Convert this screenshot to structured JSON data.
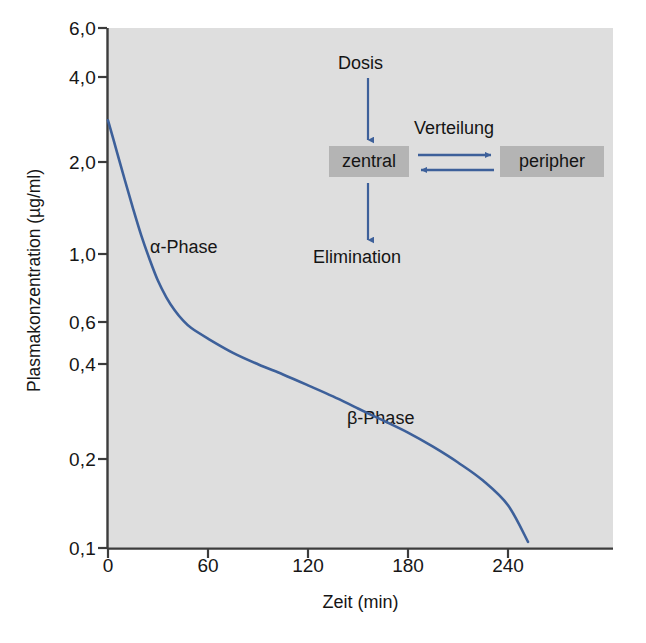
{
  "chart_data": {
    "type": "line",
    "title": "",
    "xlabel": "Zeit (min)",
    "ylabel": "Plasmakonzentration (µg/ml)",
    "yscale": "log",
    "xlim": [
      0,
      280
    ],
    "ylim": [
      0.1,
      6.0
    ],
    "grid": false,
    "legend": null,
    "xticks": [
      0,
      60,
      120,
      180,
      240
    ],
    "xticklabels": [
      "0",
      "60",
      "120",
      "180",
      "240"
    ],
    "yticks": [
      6.0,
      4.0,
      2.0,
      1.0,
      0.6,
      0.4,
      0.2,
      0.1
    ],
    "yticklabels": [
      "6,0",
      "4,0",
      "2,0",
      "1,0",
      "0,6",
      "0,4",
      "0,2",
      "0,1"
    ],
    "series": [
      {
        "name": "Plasmakonzentration",
        "color": "#3d609a",
        "x": [
          0,
          5,
          10,
          15,
          20,
          25,
          30,
          35,
          40,
          45,
          50,
          60,
          75,
          90,
          105,
          120,
          135,
          150,
          165,
          180,
          195,
          210,
          225,
          240,
          252
        ],
        "y": [
          2.9,
          2.3,
          1.82,
          1.45,
          1.17,
          0.97,
          0.82,
          0.72,
          0.65,
          0.6,
          0.565,
          0.52,
          0.465,
          0.425,
          0.392,
          0.36,
          0.33,
          0.3,
          0.273,
          0.248,
          0.222,
          0.196,
          0.17,
          0.14,
          0.105
        ]
      }
    ],
    "annotations": [
      {
        "text": "α-Phase",
        "x": 22,
        "y": 1.28
      },
      {
        "text": "β-Phase",
        "x": 148,
        "y": 0.285
      }
    ],
    "plot_background": "#dedede"
  },
  "axes": {
    "y_title": "Plasmakonzentration (µg/ml)",
    "x_title": "Zeit (min)",
    "y_labels": [
      "6,0",
      "4,0",
      "2,0",
      "1,0",
      "0,6",
      "0,4",
      "0,2",
      "0,1"
    ],
    "x_labels": [
      "0",
      "60",
      "120",
      "180",
      "240"
    ]
  },
  "annotations": {
    "alpha_phase": "α-Phase",
    "beta_phase": "β-Phase"
  },
  "inset_diagram": {
    "dose_label": "Dosis",
    "distribution_label": "Verteilung",
    "elimination_label": "Elimination",
    "central_box": "zentral",
    "peripheral_box": "peripher",
    "arrow_color": "#3d609a",
    "box_color": "#b4b4b4"
  },
  "colors": {
    "curve": "#3d609a",
    "plot_background": "#dedede",
    "axis": "#3c3c3c",
    "text": "#161616"
  }
}
